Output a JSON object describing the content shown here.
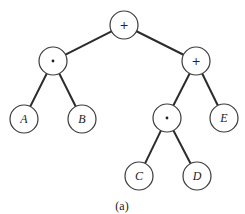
{
  "diagram": {
    "type": "expression-tree",
    "caption": "(a)",
    "nodes": [
      {
        "id": "n0",
        "label": "+",
        "kind": "operator",
        "x": 124,
        "y": 25
      },
      {
        "id": "n1",
        "label": "*",
        "kind": "operator",
        "x": 53,
        "y": 61
      },
      {
        "id": "n2",
        "label": "+",
        "kind": "operator",
        "x": 196,
        "y": 61
      },
      {
        "id": "n3",
        "label": "A",
        "kind": "operand",
        "x": 24,
        "y": 119
      },
      {
        "id": "n4",
        "label": "B",
        "kind": "operand",
        "x": 82,
        "y": 119
      },
      {
        "id": "n5",
        "label": "*",
        "kind": "operator",
        "x": 167,
        "y": 118
      },
      {
        "id": "n6",
        "label": "E",
        "kind": "operand",
        "x": 224,
        "y": 118
      },
      {
        "id": "n7",
        "label": "C",
        "kind": "operand",
        "x": 139,
        "y": 176
      },
      {
        "id": "n8",
        "label": "D",
        "kind": "operand",
        "x": 197,
        "y": 176
      }
    ],
    "edges": [
      [
        "n0",
        "n1"
      ],
      [
        "n0",
        "n2"
      ],
      [
        "n1",
        "n3"
      ],
      [
        "n1",
        "n4"
      ],
      [
        "n2",
        "n5"
      ],
      [
        "n2",
        "n6"
      ],
      [
        "n5",
        "n7"
      ],
      [
        "n5",
        "n8"
      ]
    ],
    "node_radius": 14
  }
}
